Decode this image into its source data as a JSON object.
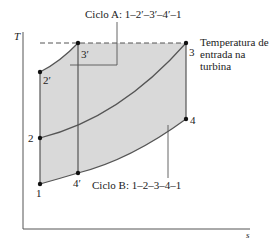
{
  "diagram": {
    "type": "T-s diagram",
    "axes": {
      "y_label": "T",
      "x_label": "s"
    },
    "points": {
      "p1": "1",
      "p2": "2",
      "p3": "3",
      "p4": "4",
      "p2p": "2′",
      "p3p": "3′",
      "p4p": "4′"
    },
    "annotations": {
      "cycle_a": "Ciclo A:  1–2′–3′–4′–1",
      "cycle_b": "Ciclo B:  1–2–3–4–1",
      "turbine_inlet_line1": "Temperatura de",
      "turbine_inlet_line2": "entrada na",
      "turbine_inlet_line3": "turbina"
    },
    "colors": {
      "fill": "#d9d9d9",
      "line": "#555555",
      "point": "#111111"
    }
  }
}
